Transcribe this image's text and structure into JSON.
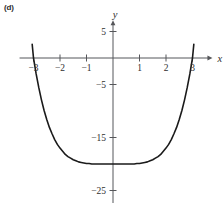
{
  "figure": {
    "panel_label": "(d)"
  },
  "chart_data": {
    "type": "line",
    "title": "",
    "subtitle": "",
    "panel": "(d)",
    "xlabel": "x",
    "ylabel": "y",
    "xlim": [
      -3.3,
      3.3
    ],
    "ylim": [
      -27,
      6
    ],
    "grid": false,
    "legend": null,
    "axis_style": "cartesian-cross-with-arrows",
    "x_ticks": [
      -3,
      -2,
      -1,
      1,
      2,
      3
    ],
    "x_tick_labels": [
      "-3",
      "-2",
      "-1",
      "1",
      "2",
      "3"
    ],
    "y_ticks": [
      5,
      -5,
      -15,
      -25
    ],
    "y_tick_labels": [
      "5",
      "-5",
      "-15",
      "-25"
    ],
    "series": [
      {
        "name": "curve",
        "color": "#1a1a1a",
        "x": [
          -3.05,
          -3.0,
          -2.9,
          -2.8,
          -2.7,
          -2.6,
          -2.5,
          -2.4,
          -2.3,
          -2.2,
          -2.1,
          -2.0,
          -1.9,
          -1.8,
          -1.7,
          -1.6,
          -1.5,
          -1.4,
          -1.3,
          -1.2,
          -1.1,
          -1.0,
          -0.9,
          -0.8,
          -0.7,
          -0.6,
          -0.5,
          -0.4,
          -0.3,
          -0.2,
          -0.1,
          0.0,
          0.1,
          0.2,
          0.3,
          0.4,
          0.5,
          0.6,
          0.7,
          0.8,
          0.9,
          1.0,
          1.1,
          1.2,
          1.3,
          1.4,
          1.5,
          1.6,
          1.7,
          1.8,
          1.9,
          2.0,
          2.1,
          2.2,
          2.3,
          2.4,
          2.5,
          2.6,
          2.7,
          2.8,
          2.9,
          3.0,
          3.05
        ],
        "y": [
          2.6,
          0.0,
          -3.0,
          -5.6,
          -7.9,
          -9.9,
          -11.6,
          -13.1,
          -14.3,
          -15.4,
          -16.3,
          -17.0,
          -17.6,
          -18.2,
          -18.6,
          -18.9,
          -19.2,
          -19.4,
          -19.6,
          -19.7,
          -19.8,
          -19.9,
          -19.9,
          -20.0,
          -20.0,
          -20.0,
          -20.0,
          -20.0,
          -20.0,
          -20.0,
          -20.0,
          -20.0,
          -20.0,
          -20.0,
          -20.0,
          -20.0,
          -20.0,
          -20.0,
          -20.0,
          -20.0,
          -19.9,
          -19.9,
          -19.8,
          -19.7,
          -19.6,
          -19.4,
          -19.2,
          -18.9,
          -18.6,
          -18.2,
          -17.6,
          -17.0,
          -16.3,
          -15.4,
          -14.3,
          -13.1,
          -11.6,
          -9.9,
          -7.9,
          -5.6,
          -3.0,
          0.0,
          2.6
        ]
      }
    ],
    "annotations": [
      {
        "text": "y",
        "role": "y-axis-name"
      },
      {
        "text": "x",
        "role": "x-axis-name"
      }
    ]
  }
}
